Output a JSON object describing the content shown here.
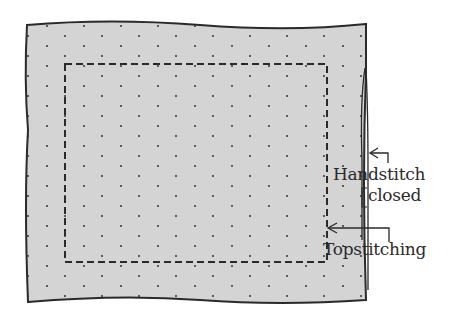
{
  "diagram": {
    "type": "sewing-instruction",
    "fabric_color": "#d4d4d4",
    "line_color": "#2a2a2a",
    "labels": {
      "handstitch": "Handstitch",
      "closed": "closed",
      "topstitching": "Topstitching"
    }
  }
}
